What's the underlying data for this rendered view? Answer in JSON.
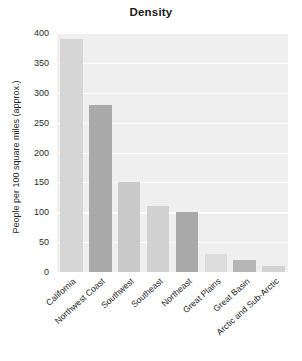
{
  "chart_data": {
    "type": "bar",
    "title": "Density",
    "xlabel": "",
    "ylabel": "People per 100 square miles (approx.)",
    "categories": [
      "California",
      "Northwest Coast",
      "Southwest",
      "Southeast",
      "Northeast",
      "Great Plains",
      "Great Basin",
      "Arctic and Sub-Arctic"
    ],
    "values": [
      390,
      280,
      150,
      110,
      100,
      30,
      20,
      10
    ],
    "ylim": [
      0,
      400
    ],
    "yticks": [
      0,
      50,
      100,
      150,
      200,
      250,
      300,
      350,
      400
    ],
    "ytick_labels": [
      "0",
      "50",
      "100",
      "150",
      "200",
      "250",
      "300",
      "350",
      "400"
    ],
    "grid": true,
    "legend": false,
    "bar_colors": [
      "#d6d6d6",
      "#a9a9a9",
      "#c9c9c9",
      "#d2d2d2",
      "#a9a9a9",
      "#dcdcdc",
      "#b5b5b5",
      "#d2d2d2"
    ],
    "panel_background": "#efefef",
    "gridline_color": "#ffffff",
    "page_background": "#ffffff",
    "text_color": "#222222"
  }
}
